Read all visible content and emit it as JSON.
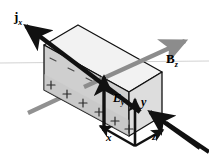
{
  "figure": {
    "kind": "physics-vector-diagram",
    "width": 209,
    "height": 157,
    "background_color": "#ffffff"
  },
  "labels": {
    "current_density": {
      "symbol": "j",
      "subscript": "x",
      "full": "jx",
      "style": "bold-upright-vector"
    },
    "magnetic_field": {
      "symbol": "B",
      "subscript": "z",
      "full": "Bz",
      "style": "bold-upright-vector"
    },
    "hall_field": {
      "symbol": "E",
      "subscript": "y",
      "full": "Ey",
      "style": "bold-italic-vector"
    },
    "axis_y": {
      "symbol": "y",
      "style": "bold-italic"
    },
    "axis_x": {
      "symbol": "x",
      "style": "bold-italic"
    },
    "axis_z": {
      "symbol": "z",
      "style": "bold-italic"
    }
  },
  "charges": {
    "positive_sign": "+",
    "negative_sign": "−",
    "positive_count": 6,
    "negative_count": 5,
    "positive_edge": "bottom-of-front-face",
    "negative_edge": "top-of-front-face"
  },
  "colors": {
    "slab_front_face": "#cfcfcf",
    "slab_top_face": "#f0f0f0",
    "slab_end_face": "#dcdcdc",
    "slab_outline": "#111111",
    "current_arrow": "#111111",
    "field_arrow": "#111111",
    "magnetic_arrow": "#8c8c8c",
    "horizon_line": "#bfbfbf",
    "label_text": "#000000"
  },
  "arrows": {
    "current_j": {
      "direction": "up-left",
      "color": "#111111",
      "heads": 2,
      "description": "current density arrow through slab along x"
    },
    "magnetic_b": {
      "direction": "up-right",
      "color": "#8c8c8c",
      "heads": 1,
      "description": "magnetic field arrow along z"
    },
    "hall_e": {
      "direction": "up",
      "color": "#111111",
      "heads": 1,
      "description": "Hall electric field arrow along y"
    },
    "axis_y": {
      "direction": "up",
      "color": "#111111",
      "heads": 1
    },
    "axis_x": {
      "direction": "left",
      "color": "#111111",
      "heads": 1
    },
    "axis_z": {
      "direction": "right",
      "color": "#111111",
      "heads": 1
    }
  }
}
